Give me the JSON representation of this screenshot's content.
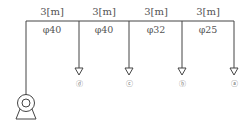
{
  "diagram": {
    "type": "pipe-network",
    "segments": [
      {
        "length": "3[m]",
        "diameter": "φ40"
      },
      {
        "length": "3[m]",
        "diameter": "φ40"
      },
      {
        "length": "3[m]",
        "diameter": "φ32"
      },
      {
        "length": "3[m]",
        "diameter": "φ25"
      }
    ],
    "outlets": [
      {
        "label": "ⓓ"
      },
      {
        "label": "ⓒ"
      },
      {
        "label": "ⓑ"
      },
      {
        "label": "ⓐ"
      }
    ],
    "source": "pump"
  }
}
